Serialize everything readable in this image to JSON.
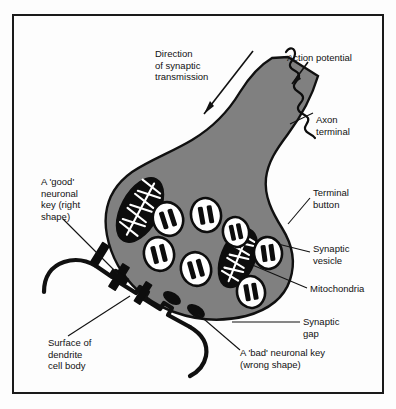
{
  "figure": {
    "frame_color": "#1a1a1a",
    "cell_fill": "#808080",
    "background": "#ffffff"
  },
  "labels": {
    "direction": {
      "name": "direction-of-synaptic-transmission",
      "line1": "Direction",
      "line2": "of synaptic",
      "line3": "transmission"
    },
    "action_potential": {
      "name": "action-potential",
      "line1": "Action potential"
    },
    "axon_terminal": {
      "name": "axon-terminal",
      "line1": "Axon",
      "line2": "terminal"
    },
    "good_key": {
      "name": "good-neuronal-key",
      "line1": "A 'good'",
      "line2": "neuronal",
      "line3": "key (right",
      "line4": "shape)"
    },
    "terminal_button": {
      "name": "terminal-button",
      "line1": "Terminal",
      "line2": "button"
    },
    "synaptic_vesicle": {
      "name": "synaptic-vesicle",
      "line1": "Synaptic",
      "line2": "vesicle"
    },
    "mitochondria": {
      "name": "mitochondria",
      "line1": "Mitochondria"
    },
    "synaptic_gap": {
      "name": "synaptic-gap",
      "line1": "Synaptic",
      "line2": "gap"
    },
    "dendrite_surface": {
      "name": "surface-of-dendrite-cell-body",
      "line1": "Surface of",
      "line2": "dendrite",
      "line3": "cell body"
    },
    "bad_key": {
      "name": "bad-neuronal-key",
      "line1": "A 'bad' neuronal key",
      "line2": "(wrong shape)"
    }
  },
  "structures": {
    "vesicle_count": 7,
    "mitochondria_count": 2,
    "good_key_count": 3,
    "bad_key_count": 2,
    "vesicles": [
      {
        "cx": 168,
        "cy": 219,
        "rx": 15,
        "ry": 17,
        "rot": -18
      },
      {
        "cx": 206,
        "cy": 215,
        "rx": 15,
        "ry": 17,
        "rot": -10
      },
      {
        "cx": 159,
        "cy": 254,
        "rx": 15,
        "ry": 17,
        "rot": -14
      },
      {
        "cx": 196,
        "cy": 269,
        "rx": 15,
        "ry": 17,
        "rot": -16
      },
      {
        "cx": 268,
        "cy": 253,
        "rx": 14,
        "ry": 16,
        "rot": -8
      },
      {
        "cx": 251,
        "cy": 292,
        "rx": 14,
        "ry": 16,
        "rot": -10
      },
      {
        "cx": 236,
        "cy": 232,
        "rx": 13,
        "ry": 15,
        "rot": -12
      }
    ],
    "mitochondria": [
      {
        "cx": 140,
        "cy": 210,
        "rx": 19,
        "ry": 35,
        "rot": 28
      },
      {
        "cx": 238,
        "cy": 258,
        "rx": 17,
        "ry": 31,
        "rot": 22
      }
    ]
  }
}
